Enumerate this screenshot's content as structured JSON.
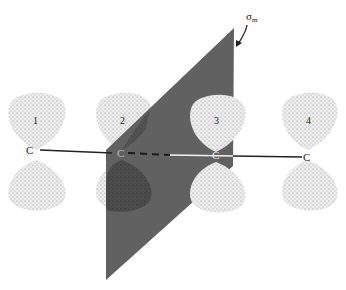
{
  "diagram": {
    "plane_label": "σm",
    "plane_label_main": "σ",
    "plane_label_sub": "m",
    "atom_label": "C",
    "orbitals": [
      {
        "index": 1,
        "label": "1"
      },
      {
        "index": 2,
        "label": "2"
      },
      {
        "index": 3,
        "label": "3"
      },
      {
        "index": 4,
        "label": "4"
      }
    ],
    "colors": {
      "plane": "#5a5a5a",
      "lobe": "#e6e6e6",
      "stipple": "#8a8a8a",
      "bond": "#222222"
    }
  }
}
